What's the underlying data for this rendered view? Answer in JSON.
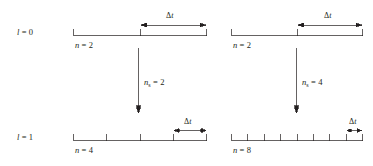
{
  "figure": {
    "background_color": "#ffffff",
    "line_color": "#231f20",
    "rows": [
      {
        "id": "row-l0",
        "level_label": "l = 0",
        "level_symbol": "l",
        "level_value": "0",
        "panels": [
          {
            "id": "panel-l0-left",
            "n_label": "n = 2",
            "n_symbol": "n",
            "n_value": "2",
            "segments": 2,
            "dt_label": "Δt",
            "dt_span_segments": 1
          },
          {
            "id": "panel-l0-right",
            "n_label": "n = 2",
            "n_symbol": "n",
            "n_value": "2",
            "segments": 2,
            "dt_label": "Δt",
            "dt_span_segments": 1
          }
        ]
      },
      {
        "id": "row-l1",
        "level_label": "l = 1",
        "level_symbol": "l",
        "level_value": "1",
        "panels": [
          {
            "id": "panel-l1-left",
            "n_label": "n = 4",
            "n_symbol": "n",
            "n_value": "4",
            "segments": 4,
            "dt_label": "Δt",
            "dt_span_segments": 1
          },
          {
            "id": "panel-l1-right",
            "n_label": "n = 8",
            "n_symbol": "n",
            "n_value": "8",
            "segments": 8,
            "dt_label": "Δt",
            "dt_span_segments": 1
          }
        ]
      }
    ],
    "refinement_arrows": [
      {
        "id": "refinement-left",
        "label": "n_s = 2",
        "symbol": "n",
        "subscript": "s",
        "value": "2"
      },
      {
        "id": "refinement-right",
        "label": "n_s = 4",
        "symbol": "n",
        "subscript": "s",
        "value": "4"
      }
    ]
  }
}
